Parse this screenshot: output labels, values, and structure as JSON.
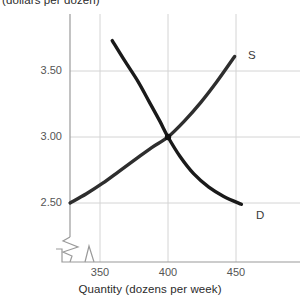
{
  "chart_data": {
    "type": "line",
    "title": "",
    "ylabel": "(dollars per dozen)",
    "xlabel": "Quantity (dozens per week)",
    "xticks": [
      350,
      400,
      450
    ],
    "xtick_labels": [
      "350",
      "400",
      "450"
    ],
    "yticks": [
      2.5,
      3.0,
      3.5
    ],
    "ytick_labels": [
      "2.50",
      "3.00",
      "3.50"
    ],
    "xlim": [
      327,
      470
    ],
    "ylim": [
      2.37,
      3.78
    ],
    "grid": true,
    "axis_break_x": true,
    "axis_break_y": true,
    "legend_position": "inline-curve-labels",
    "equilibrium": {
      "quantity": 400,
      "price": 3.0,
      "marker": "intersection-dot"
    },
    "series": [
      {
        "name": "Demand",
        "label": "D",
        "color": "#1a1a1a",
        "shape": "convex-decreasing",
        "points": [
          {
            "x": 359,
            "y": 3.73
          },
          {
            "x": 368,
            "y": 3.58
          },
          {
            "x": 378,
            "y": 3.42
          },
          {
            "x": 386,
            "y": 3.27
          },
          {
            "x": 394,
            "y": 3.12
          },
          {
            "x": 400,
            "y": 3.0
          },
          {
            "x": 409,
            "y": 2.85
          },
          {
            "x": 419,
            "y": 2.72
          },
          {
            "x": 430,
            "y": 2.62
          },
          {
            "x": 441,
            "y": 2.55
          },
          {
            "x": 454,
            "y": 2.49
          }
        ]
      },
      {
        "name": "Supply",
        "label": "S",
        "color": "#2e2e2e",
        "shape": "convex-increasing",
        "points": [
          {
            "x": 328,
            "y": 2.5
          },
          {
            "x": 340,
            "y": 2.57
          },
          {
            "x": 352,
            "y": 2.65
          },
          {
            "x": 364,
            "y": 2.74
          },
          {
            "x": 376,
            "y": 2.83
          },
          {
            "x": 388,
            "y": 2.92
          },
          {
            "x": 400,
            "y": 3.0
          },
          {
            "x": 412,
            "y": 3.12
          },
          {
            "x": 424,
            "y": 3.26
          },
          {
            "x": 436,
            "y": 3.42
          },
          {
            "x": 449,
            "y": 3.61
          }
        ]
      }
    ]
  },
  "labels": {
    "supply_curve": "S",
    "demand_curve": "D"
  },
  "colors": {
    "grid": "#d4d4d4",
    "axis": "#9a9a9a",
    "demand_line": "#1a1a1a",
    "supply_line": "#2e2e2e",
    "text": "#2b2b2b",
    "tick_text": "#555555",
    "background": "#ffffff"
  }
}
